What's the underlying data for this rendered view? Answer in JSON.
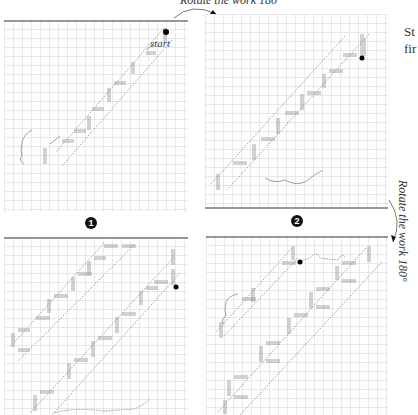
{
  "annotations": {
    "rotate_top": "Rotate the work 180°",
    "rotate_side": "Rotate the work 180°",
    "start_label": "start"
  },
  "steps": [
    {
      "number": "1",
      "glyph": "❶"
    },
    {
      "number": "2",
      "glyph": "❷"
    }
  ],
  "side_text": {
    "line1": "St",
    "line2": "fir"
  },
  "panels": [
    {
      "id": "panel-1",
      "step": "1",
      "bands": 1,
      "has_start": true
    },
    {
      "id": "panel-2",
      "step": "2",
      "bands": 1,
      "has_start": true
    },
    {
      "id": "panel-3",
      "step": "",
      "bands": 2,
      "has_start": true
    },
    {
      "id": "panel-4",
      "step": "",
      "bands": 2,
      "has_start": true
    }
  ],
  "colors": {
    "grid": "#c8c8c8",
    "grid_edge": "#777777",
    "stitch": "#9a9a9a",
    "dotted": "#9a9a9a",
    "dot": "#000000"
  }
}
